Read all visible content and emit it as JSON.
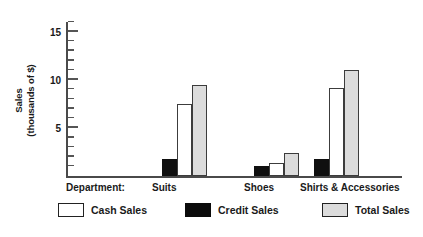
{
  "chart_data": {
    "type": "bar",
    "title": "",
    "xlabel": "Department:",
    "ylabel": "Sales\n(thousands of $)",
    "ylabel_line1": "Sales",
    "ylabel_line2": "(thousands of $)",
    "categories": [
      "Suits",
      "Shoes",
      "Shirts & Accessories"
    ],
    "series": [
      {
        "name": "Credit Sales",
        "color": "#101010",
        "values": [
          1.8,
          1.0,
          1.8
        ]
      },
      {
        "name": "Cash Sales",
        "color": "#ffffff",
        "values": [
          7.5,
          1.4,
          9.1
        ]
      },
      {
        "name": "Total Sales",
        "color": "#dcdcdc",
        "values": [
          9.5,
          2.4,
          11.0
        ]
      }
    ],
    "ylim": [
      0,
      16
    ],
    "ytick_labels": [
      "5",
      "10",
      "15"
    ],
    "ytick_values": [
      5,
      10,
      15
    ],
    "yminor_step": 1,
    "grid": false,
    "legend_position": "bottom",
    "legend": [
      {
        "label": "Cash Sales",
        "swatch": "white"
      },
      {
        "label": "Credit Sales",
        "swatch": "black"
      },
      {
        "label": "Total Sales",
        "swatch": "gray"
      }
    ]
  },
  "axis": {
    "y_title_line1": "Sales",
    "y_title_line2": "(thousands of $)",
    "tick_15": "15",
    "tick_10": "10",
    "tick_5": "5"
  },
  "categories": {
    "department_prefix": "Department:",
    "cat_0": "Suits",
    "cat_1": "Shoes",
    "cat_2": "Shirts & Accessories"
  },
  "legend": {
    "cash": "Cash Sales",
    "credit": "Credit Sales",
    "total": "Total Sales"
  }
}
